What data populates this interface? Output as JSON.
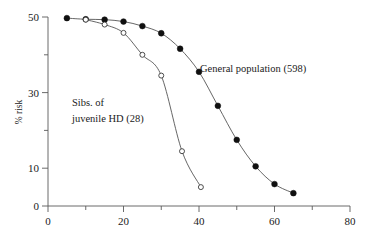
{
  "chart_data": {
    "type": "line",
    "title": "",
    "subtitle": "",
    "xlabel": "",
    "ylabel": "% risk",
    "xlim": [
      0,
      80
    ],
    "ylim": [
      0,
      50
    ],
    "grid": false,
    "legend_position": "inline-annotation",
    "x_ticks_major": [
      0,
      20,
      40,
      60,
      80
    ],
    "x_ticks_minor": [
      10,
      30,
      50,
      70
    ],
    "y_ticks_major": [
      0,
      10,
      30,
      50
    ],
    "y_ticks_minor": [
      20,
      40
    ],
    "x_tick_labels": [
      "0",
      "20",
      "40",
      "60",
      "80"
    ],
    "y_tick_labels": [
      "0",
      "10",
      "30",
      "50"
    ],
    "annotations": [
      {
        "name": "general-population-label",
        "text": "General population (598)",
        "x": 52.5,
        "y": 37.5
      },
      {
        "name": "sibs-juvenile-hd-label-line1",
        "text": "Sibs. of",
        "x": 20.0,
        "y": 27.0
      },
      {
        "name": "sibs-juvenile-hd-label-line2",
        "text": "juvenile HD (28)",
        "x": 20.0,
        "y": 22.0
      }
    ],
    "series": [
      {
        "name": "General population (598)",
        "marker": "filled-circle",
        "n": 598,
        "x": [
          5,
          10,
          15,
          20,
          25,
          30,
          35,
          40,
          45,
          50,
          55,
          60,
          65
        ],
        "values": [
          49.7,
          49.4,
          49.3,
          48.8,
          47.6,
          45.7,
          41.6,
          35.5,
          26.5,
          17.5,
          10.5,
          5.8,
          3.4
        ]
      },
      {
        "name": "Sibs. of juvenile HD (28)",
        "marker": "open-circle",
        "n": 28,
        "x": [
          10,
          15,
          20,
          25,
          30,
          35.5,
          40.5
        ],
        "values": [
          49.3,
          48.0,
          45.8,
          40.0,
          34.5,
          14.5,
          5.0
        ]
      }
    ]
  }
}
